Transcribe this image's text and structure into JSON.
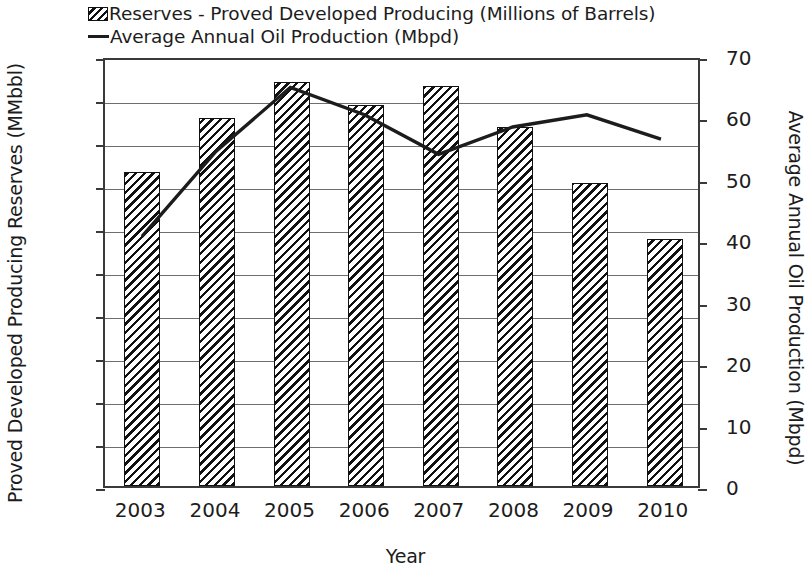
{
  "chart_data": {
    "type": "bar",
    "title": "",
    "xlabel": "Year",
    "ylabel": "Proved Developed Producing Reserves (MMbbl)",
    "ylabel_secondary": "Average Annual Oil Production (Mbpd)",
    "categories": [
      "2003",
      "2004",
      "2005",
      "2006",
      "2007",
      "2008",
      "2009",
      "2010"
    ],
    "ylim": [
      0,
      200
    ],
    "yticks": [
      200,
      180,
      160,
      140,
      120,
      100,
      80,
      60,
      40,
      20,
      0
    ],
    "ylim_secondary": [
      0,
      70
    ],
    "yticks_secondary": [
      70,
      60,
      50,
      40,
      30,
      20,
      10,
      0
    ],
    "grid": true,
    "legend_position": "top",
    "series": [
      {
        "name": "Reserves - Proved Developed Producing (Millions of Barrels)",
        "type": "bar",
        "axis": "left",
        "values": [
          146,
          171,
          188,
          177,
          186,
          167,
          141,
          115
        ]
      },
      {
        "name": "Average Annual Oil Production (Mbpd)",
        "type": "line",
        "axis": "right",
        "values": [
          41,
          55,
          65.5,
          61,
          54.5,
          59,
          61,
          57
        ]
      }
    ]
  },
  "legend": {
    "items": [
      {
        "label": "Reserves - Proved Developed Producing (Millions of Barrels)",
        "swatch": "hatched-bar-swatch"
      },
      {
        "label": "Average Annual Oil Production (Mbpd)",
        "swatch": "line-swatch"
      }
    ]
  },
  "colors": {
    "line": "#1c1c1c",
    "bar_hatch": "#111111",
    "axis": "#3a3a3a",
    "grid": "#6e6e6e",
    "background": "#ffffff"
  }
}
